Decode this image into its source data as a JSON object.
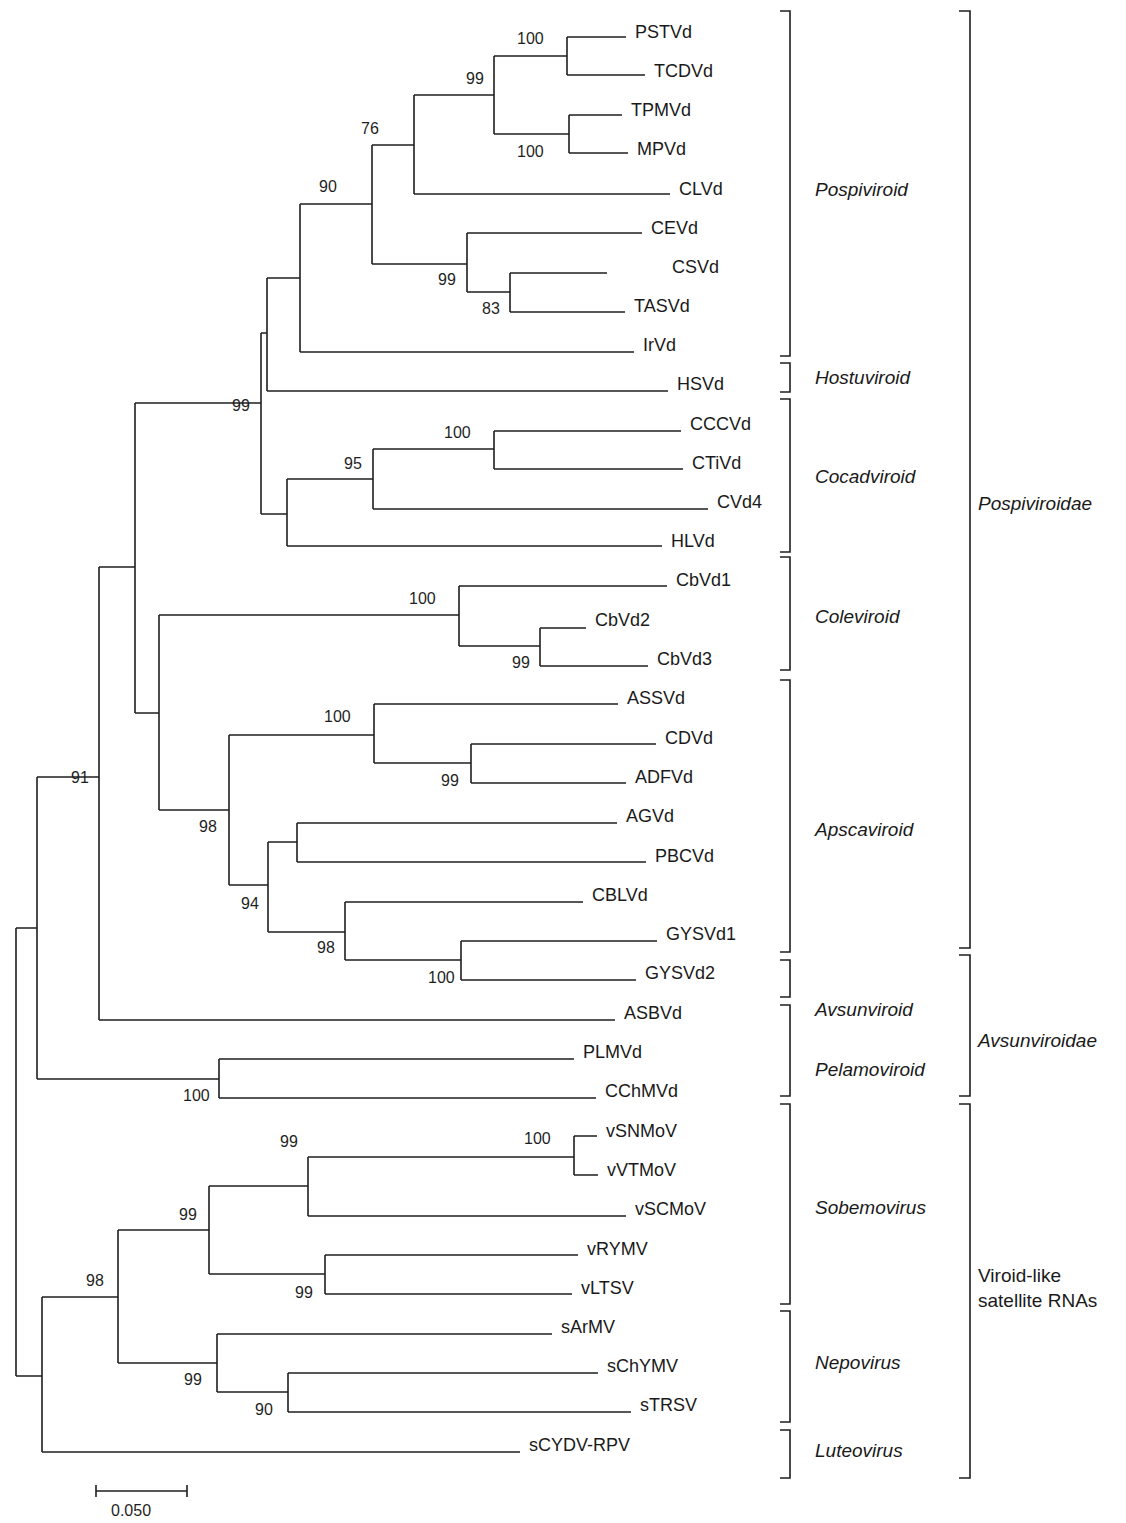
{
  "chart_data": {
    "type": "phylogenetic_tree",
    "title": "",
    "scale_bar": {
      "label": "0.050",
      "x1": 96,
      "x2": 187,
      "y": 1491
    },
    "leaves": [
      {
        "name": "PSTVd",
        "x": 626,
        "y": 32
      },
      {
        "name": "TCDVd",
        "x": 645,
        "y": 71
      },
      {
        "name": "TPMVd",
        "x": 622,
        "y": 110
      },
      {
        "name": "MPVd",
        "x": 628,
        "y": 149
      },
      {
        "name": "CLVd",
        "x": 670,
        "y": 189
      },
      {
        "name": "CEVd",
        "x": 642,
        "y": 228
      },
      {
        "name": "CSVd",
        "x": 663,
        "y": 267
      },
      {
        "name": "TASVd",
        "x": 625,
        "y": 306
      },
      {
        "name": "IrVd",
        "x": 634,
        "y": 345
      },
      {
        "name": "HSVd",
        "x": 668,
        "y": 384
      },
      {
        "name": "CCCVd",
        "x": 681,
        "y": 424
      },
      {
        "name": "CTiVd",
        "x": 683,
        "y": 463
      },
      {
        "name": "CVd4",
        "x": 708,
        "y": 502
      },
      {
        "name": "HLVd",
        "x": 662,
        "y": 541
      },
      {
        "name": "CbVd1",
        "x": 667,
        "y": 580
      },
      {
        "name": "CbVd2",
        "x": 586,
        "y": 620
      },
      {
        "name": "CbVd3",
        "x": 648,
        "y": 659
      },
      {
        "name": "ASSVd",
        "x": 618,
        "y": 698
      },
      {
        "name": "CDVd",
        "x": 656,
        "y": 738
      },
      {
        "name": "ADFVd",
        "x": 626,
        "y": 777
      },
      {
        "name": "AGVd",
        "x": 617,
        "y": 816
      },
      {
        "name": "PBCVd",
        "x": 646,
        "y": 856
      },
      {
        "name": "CBLVd",
        "x": 583,
        "y": 895
      },
      {
        "name": "GYSVd1",
        "x": 657,
        "y": 934
      },
      {
        "name": "GYSVd2",
        "x": 636,
        "y": 973
      },
      {
        "name": "ASBVd",
        "x": 615,
        "y": 1013
      },
      {
        "name": "PLMVd",
        "x": 574,
        "y": 1052
      },
      {
        "name": "CChMVd",
        "x": 596,
        "y": 1091
      },
      {
        "name": "vSNMoV",
        "x": 597,
        "y": 1131
      },
      {
        "name": "vVTMoV",
        "x": 598,
        "y": 1170
      },
      {
        "name": "vSCMoV",
        "x": 626,
        "y": 1209
      },
      {
        "name": "vRYMV",
        "x": 578,
        "y": 1249
      },
      {
        "name": "vLTSV",
        "x": 572,
        "y": 1288
      },
      {
        "name": "sArMV",
        "x": 552,
        "y": 1327
      },
      {
        "name": "sChYMV",
        "x": 598,
        "y": 1366
      },
      {
        "name": "sTRSV",
        "x": 631,
        "y": 1405
      },
      {
        "name": "sCYDV-RPV",
        "x": 520,
        "y": 1445
      }
    ],
    "support_values": [
      {
        "value": "100",
        "x": 517,
        "y": 44
      },
      {
        "value": "99",
        "x": 466,
        "y": 84
      },
      {
        "value": "100",
        "x": 517,
        "y": 157
      },
      {
        "value": "76",
        "x": 361,
        "y": 134
      },
      {
        "value": "90",
        "x": 319,
        "y": 192
      },
      {
        "value": "99",
        "x": 438,
        "y": 285
      },
      {
        "value": "83",
        "x": 482,
        "y": 314
      },
      {
        "value": "99",
        "x": 232,
        "y": 411
      },
      {
        "value": "100",
        "x": 444,
        "y": 438
      },
      {
        "value": "95",
        "x": 344,
        "y": 469
      },
      {
        "value": "100",
        "x": 409,
        "y": 604
      },
      {
        "value": "99",
        "x": 512,
        "y": 668
      },
      {
        "value": "100",
        "x": 324,
        "y": 722
      },
      {
        "value": "99",
        "x": 441,
        "y": 786
      },
      {
        "value": "91",
        "x": 71,
        "y": 783
      },
      {
        "value": "98",
        "x": 199,
        "y": 832
      },
      {
        "value": "94",
        "x": 241,
        "y": 909
      },
      {
        "value": "98",
        "x": 317,
        "y": 953
      },
      {
        "value": "100",
        "x": 428,
        "y": 983
      },
      {
        "value": "100",
        "x": 183,
        "y": 1101
      },
      {
        "value": "100",
        "x": 524,
        "y": 1144
      },
      {
        "value": "99",
        "x": 280,
        "y": 1147
      },
      {
        "value": "99",
        "x": 179,
        "y": 1220
      },
      {
        "value": "98",
        "x": 86,
        "y": 1286
      },
      {
        "value": "99",
        "x": 295,
        "y": 1298
      },
      {
        "value": "99",
        "x": 184,
        "y": 1385
      },
      {
        "value": "90",
        "x": 255,
        "y": 1415
      }
    ],
    "branches": [
      "M567 37 H626 M567 37 V75 M567 75 H645",
      "M569 115 H622 M569 115 V153 M569 153 H628",
      "M494 56 H567 M494 56 V134 M494 134 H569",
      "M414 95 H494 M414 95 V194 M414 194 H670",
      "M372 145 H414 M372 145 V264 M372 264 H467",
      "M510 273 H607 M510 273 V312 M510 312 H625",
      "M467 233 H642 M467 233 V292 M467 292 H510",
      "M300 204 H372 M300 204 V352 M300 352 H634",
      "M267 278 H300 M267 278 V391 M267 391 H668",
      "M494 431 H681 M494 431 V469 M494 469 H683",
      "M373 449 H494 M373 449 V509 M373 509 H708",
      "M287 479 H373 M287 479 V546 M287 546 H662",
      "M261 333 H267 M261 333 V514 M261 514 H287",
      "M540 628 H586 M540 628 V666 M540 666 H648",
      "M459 586 H667 M459 586 V646 M459 646 H540",
      "M471 744 H656 M471 744 V783 M471 783 H626",
      "M374 704 H618 M374 704 V763 M374 763 H471",
      "M297 823 H617 M297 823 V862 M297 862 H646",
      "M461 941 H657 M461 941 V980 M461 980 H636",
      "M345 902 H583 M345 902 V960 M345 960 H461",
      "M268 842 H297 M268 842 V932 M268 932 H345",
      "M229 735 H374 M229 735 V885 M229 885 H268",
      "M159 615 H459 M159 615 V810 M159 810 H229",
      "M135 403 H261 M135 403 V713 M135 713 H159",
      "M99 567 H135 M99 567 V1020 M99 1020 H615",
      "M219 1059 H574 M219 1059 V1098 M219 1098 H596",
      "M37 777 H99 M37 777 V1079 M37 1079 H219",
      "M574 1136 H597 M574 1136 V1175 M574 1175 H598",
      "M308 1157 H574 M308 1157 V1216 M308 1216 H626",
      "M325 1255 H578 M325 1255 V1294 M325 1294 H572",
      "M209 1186 H308 M209 1186 V1274 M209 1274 H325",
      "M288 1373 H598 M288 1373 V1412 M288 1412 H631",
      "M217 1334 H552 M217 1334 V1392 M217 1392 H288",
      "M118 1230 H209 M118 1230 V1363 M118 1363 H217",
      "M42 1297 H118 M42 1297 V1452 M42 1452 H520",
      "M16 928 H37 M16 928 V1376 M16 1376 H42"
    ],
    "genus_brackets": [
      {
        "name": "Pospiviroid",
        "y1": 11,
        "y2": 356,
        "label_y": 196
      },
      {
        "name": "Hostuviroid",
        "y1": 363,
        "y2": 392,
        "label_y": 384
      },
      {
        "name": "Cocadviroid",
        "y1": 399,
        "y2": 552,
        "label_y": 483
      },
      {
        "name": "Coleviroid",
        "y1": 557,
        "y2": 670,
        "label_y": 623
      },
      {
        "name": "Apscaviroid",
        "y1": 680,
        "y2": 952,
        "label_y": 836
      },
      {
        "name": "Avsunviroid",
        "y1": 960,
        "y2": 997,
        "label_y": 1016
      },
      {
        "name": "Pelamoviroid",
        "y1": 1005,
        "y2": 1096,
        "label_y": 1076
      },
      {
        "name": "Sobemovirus",
        "y1": 1104,
        "y2": 1304,
        "label_y": 1214
      },
      {
        "name": "Nepovirus",
        "y1": 1311,
        "y2": 1422,
        "label_y": 1369
      },
      {
        "name": "Luteovirus",
        "y1": 1430,
        "y2": 1478,
        "label_y": 1457
      }
    ],
    "family_brackets": [
      {
        "name": "Pospiviroidae",
        "italic": true,
        "y1": 11,
        "y2": 948,
        "label_lines": [
          "Pospiviroidae"
        ],
        "label_y": 510
      },
      {
        "name": "Avsunviroidae",
        "italic": true,
        "y1": 955,
        "y2": 1096,
        "label_lines": [
          "Avsunviroidae"
        ],
        "label_y": 1047
      },
      {
        "name": "Viroid-like satellite RNAs",
        "italic": false,
        "y1": 1104,
        "y2": 1478,
        "label_lines": [
          "Viroid-like",
          "satellite RNAs"
        ],
        "label_y": 1282
      }
    ]
  }
}
